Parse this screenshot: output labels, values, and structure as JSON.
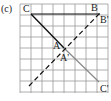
{
  "figure": {
    "tag": "(c)",
    "grid": {
      "cols": 8,
      "rows": 8,
      "color": "#9a9a9a"
    },
    "points": {
      "C": {
        "label": "C"
      },
      "B": {
        "label": "B"
      },
      "B_prime": {
        "label": "B'"
      },
      "A": {
        "label": "A"
      },
      "A_prime": {
        "label": "A'"
      },
      "C_prime": {
        "label": "C'"
      }
    },
    "segments": [
      {
        "name": "CB",
        "style": "solid",
        "color": "#111111"
      },
      {
        "name": "CA",
        "style": "solid",
        "color": "#111111"
      },
      {
        "name": "A'C'",
        "style": "solid",
        "color": "#888888"
      },
      {
        "name": "mirror-line",
        "style": "dashed",
        "color": "#111111"
      }
    ]
  }
}
